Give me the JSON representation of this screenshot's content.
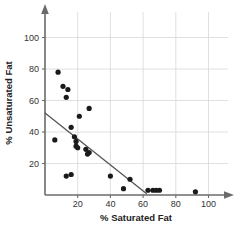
{
  "chart_data": {
    "type": "scatter",
    "title": "",
    "xlabel": "% Saturated Fat",
    "ylabel": "% Unsaturated Fat",
    "xlim": [
      0,
      112
    ],
    "ylim": [
      0,
      112
    ],
    "xticks": [
      20,
      40,
      60,
      80,
      100
    ],
    "yticks": [
      20,
      40,
      60,
      80,
      100
    ],
    "xtick_labels": [
      "20",
      "40",
      "60",
      "80",
      "100"
    ],
    "ytick_labels": [
      "20",
      "40",
      "60",
      "80",
      "100"
    ],
    "grid": true,
    "legend": "none",
    "points": [
      {
        "x": 8,
        "y": 78
      },
      {
        "x": 11,
        "y": 69
      },
      {
        "x": 14,
        "y": 67
      },
      {
        "x": 13,
        "y": 62
      },
      {
        "x": 27,
        "y": 55
      },
      {
        "x": 21,
        "y": 50
      },
      {
        "x": 16,
        "y": 43
      },
      {
        "x": 6,
        "y": 35
      },
      {
        "x": 18,
        "y": 37
      },
      {
        "x": 19,
        "y": 34
      },
      {
        "x": 19,
        "y": 31
      },
      {
        "x": 20,
        "y": 30
      },
      {
        "x": 25,
        "y": 29
      },
      {
        "x": 27,
        "y": 27
      },
      {
        "x": 26,
        "y": 26
      },
      {
        "x": 13,
        "y": 12
      },
      {
        "x": 16,
        "y": 13
      },
      {
        "x": 40,
        "y": 12
      },
      {
        "x": 52,
        "y": 10
      },
      {
        "x": 48,
        "y": 4
      },
      {
        "x": 63,
        "y": 3
      },
      {
        "x": 66,
        "y": 3
      },
      {
        "x": 68,
        "y": 3
      },
      {
        "x": 70,
        "y": 3
      },
      {
        "x": 92,
        "y": 2
      }
    ],
    "trend_line": {
      "x_start": 0,
      "y_start": 52,
      "x_end": 62,
      "y_end": 1
    },
    "colors": {
      "point": "#1a1a1a",
      "trend": "#555555",
      "grid": "#d8d8d8",
      "axis": "#6b6b6b",
      "background": "#ffffff"
    }
  }
}
